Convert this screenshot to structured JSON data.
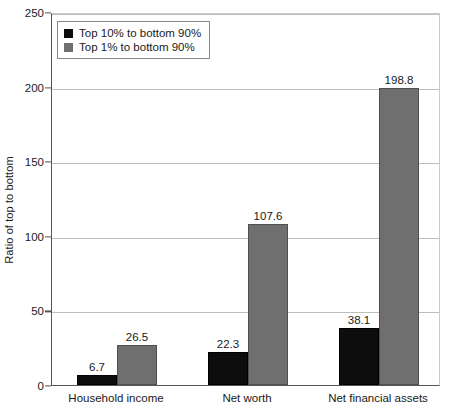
{
  "chart_data": {
    "type": "bar",
    "title": "",
    "xlabel": "",
    "ylabel": "Ratio of top to bottom",
    "ylim": [
      0,
      250
    ],
    "yticks": [
      0,
      50,
      100,
      150,
      200,
      250
    ],
    "ytick_labels": [
      "0",
      "50",
      "100",
      "150",
      "200",
      "250"
    ],
    "grid": true,
    "legend_position": "upper-left-inside",
    "categories": [
      "Household income",
      "Net worth",
      "Net financial assets"
    ],
    "series": [
      {
        "name": "Top 10% to bottom 90%",
        "color": "#0d0d0d",
        "values": [
          6.7,
          22.3,
          38.1
        ],
        "value_labels": [
          "6.7",
          "22.3",
          "38.1"
        ]
      },
      {
        "name": "Top 1% to bottom 90%",
        "color": "#6f6f6f",
        "values": [
          26.5,
          107.6,
          198.8
        ],
        "value_labels": [
          "26.5",
          "107.6",
          "198.8"
        ]
      }
    ]
  },
  "legend": {
    "items": [
      {
        "label": "Top 10% to bottom 90%",
        "swatch": "black"
      },
      {
        "label": "Top 1% to bottom 90%",
        "swatch": "gray"
      }
    ]
  },
  "axes": {
    "y_title": "Ratio of top to bottom"
  }
}
